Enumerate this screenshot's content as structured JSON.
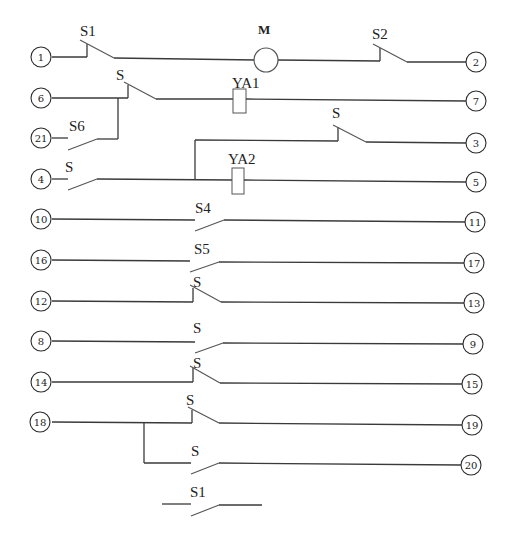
{
  "diagram": {
    "title": "",
    "colors": {
      "line": "#3a3a3a",
      "background": "#ffffff"
    },
    "components": {
      "motor": {
        "label": "M"
      },
      "coil_ya1": {
        "label": "YA1"
      },
      "coil_ya2": {
        "label": "YA2"
      }
    },
    "switch_labels": {
      "s1_top": "S1",
      "s2": "S2",
      "s_row6": "S",
      "s6": "S6",
      "s_row3": "S",
      "s_row4": "S",
      "s4": "S4",
      "s5": "S5",
      "s_row12": "S",
      "s_row8": "S",
      "s_row14": "S",
      "s_row18": "S",
      "s_row20": "S",
      "s1_bottom": "S1"
    },
    "terminals": {
      "t1": "1",
      "t2": "2",
      "t3": "3",
      "t4": "4",
      "t5": "5",
      "t6": "6",
      "t7": "7",
      "t8": "8",
      "t9": "9",
      "t10": "10",
      "t11": "11",
      "t12": "12",
      "t13": "13",
      "t14": "14",
      "t15": "15",
      "t16": "16",
      "t17": "17",
      "t18": "18",
      "t19": "19",
      "t20": "20",
      "t21": "21"
    }
  }
}
